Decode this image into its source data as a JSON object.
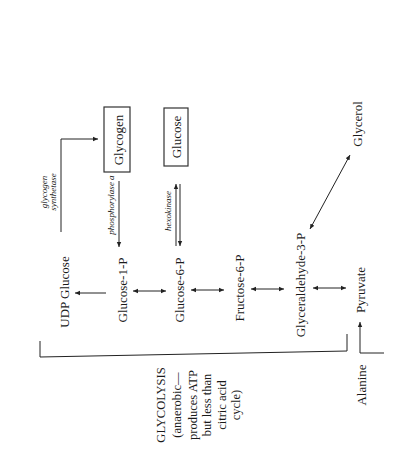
{
  "diagram": {
    "nodes": {
      "glycogen": "Glycogen",
      "glucose": "Glucose",
      "glycerol": "Glycerol",
      "udp_glucose": "UDP Glucose",
      "glucose_1p": "Glucose-1-P",
      "glucose_6p": "Glucose-6-P",
      "fructose_6p": "Fructose-6-P",
      "glyceraldehyde_3p": "Glyceraldehyde-3-P",
      "pyruvate": "Pyruvate",
      "alanine": "Alanine"
    },
    "enzymes": {
      "glycogen_synthetase_1": "glycogen",
      "glycogen_synthetase_2": "synthetase",
      "phosphorylase": "phosphorylase a",
      "hexokinase": "hexokinase"
    },
    "glycolysis_note": {
      "line1": "GLYCOLYSIS",
      "line2": "(anaerobic—",
      "line3": "produces ATP",
      "line4": "but less than",
      "line5": "citric acid",
      "line6": "cycle)"
    },
    "edges": [
      {
        "from": "Glucose-1-P",
        "to": "UDP Glucose",
        "type": "one-way"
      },
      {
        "from": "UDP Glucose",
        "to": "Glycogen",
        "type": "one-way",
        "label": "glycogen synthetase"
      },
      {
        "from": "Glycogen",
        "to": "Glucose-1-P",
        "type": "one-way",
        "label": "phosphorylase a"
      },
      {
        "from": "Glucose-6-P",
        "to": "Glucose",
        "type": "reversible",
        "label": "hexokinase"
      },
      {
        "from": "Glucose-1-P",
        "to": "Glucose-6-P",
        "type": "two-way"
      },
      {
        "from": "Glucose-6-P",
        "to": "Fructose-6-P",
        "type": "two-way"
      },
      {
        "from": "Fructose-6-P",
        "to": "Glyceraldehyde-3-P",
        "type": "two-way"
      },
      {
        "from": "Glyceraldehyde-3-P",
        "to": "Pyruvate",
        "type": "two-way"
      },
      {
        "from": "Glyceraldehyde-3-P",
        "to": "Glycerol",
        "type": "two-way"
      },
      {
        "from": "Alanine",
        "to": "Pyruvate",
        "type": "one-way"
      }
    ]
  }
}
